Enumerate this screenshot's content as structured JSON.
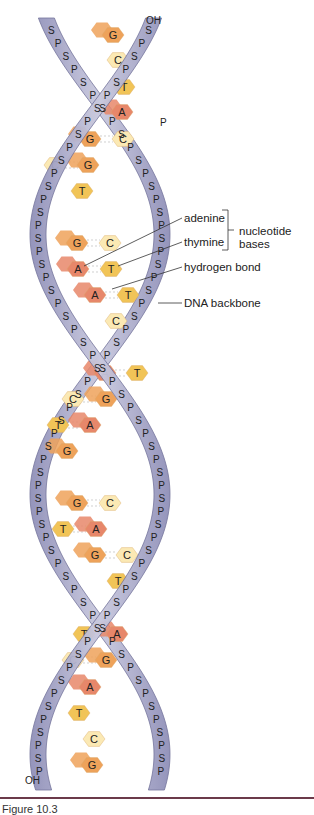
{
  "diagram": {
    "ends": {
      "top_right": "OH",
      "top_left_strand2": "P",
      "bottom_left": "OH"
    },
    "backbone_letters": {
      "sugar": "S",
      "phosphate": "P"
    },
    "colors": {
      "backbone": "#8f8fb8",
      "backbone_light": "#c9c9de",
      "adenine": "#e7876a",
      "thymine": "#f1c457",
      "guanine": "#eea25a",
      "cytosine": "#fbe9b4",
      "leader_line": "#333333",
      "caption_rule": "#6b3a4a"
    },
    "base_pairs": [
      {
        "y": 35,
        "left": {
          "b": "G",
          "x": 113
        },
        "right": null
      },
      {
        "y": 60,
        "left": {
          "b": "C",
          "x": 118
        },
        "right": null
      },
      {
        "y": 87,
        "left": {
          "b": "T",
          "x": 124
        },
        "right": null
      },
      {
        "y": 112,
        "left": {
          "b": "A",
          "x": 122
        },
        "right": null
      },
      {
        "y": 139,
        "left": {
          "b": "G",
          "x": 90
        },
        "right": {
          "b": "C",
          "x": 123
        }
      },
      {
        "y": 165,
        "left": {
          "b": "C",
          "x": 55
        },
        "right": {
          "b": "G",
          "x": 88
        }
      },
      {
        "y": 191,
        "left": null,
        "right": {
          "b": "T",
          "x": 82
        }
      },
      {
        "y": 243,
        "left": {
          "b": "G",
          "x": 77
        },
        "right": {
          "b": "C",
          "x": 110
        }
      },
      {
        "y": 269,
        "left": {
          "b": "A",
          "x": 78
        },
        "right": {
          "b": "T",
          "x": 111
        }
      },
      {
        "y": 295,
        "left": {
          "b": "A",
          "x": 95
        },
        "right": {
          "b": "T",
          "x": 128
        }
      },
      {
        "y": 321,
        "left": null,
        "right": {
          "b": "C",
          "x": 116
        }
      },
      {
        "y": 373,
        "left": {
          "b": "A",
          "x": 105
        },
        "right": {
          "b": "T",
          "x": 137
        }
      },
      {
        "y": 399,
        "left": {
          "b": "C",
          "x": 73
        },
        "right": {
          "b": "G",
          "x": 106
        }
      },
      {
        "y": 425,
        "left": {
          "b": "T",
          "x": 58
        },
        "right": {
          "b": "A",
          "x": 90
        }
      },
      {
        "y": 451,
        "left": {
          "b": "G",
          "x": 67
        },
        "right": null
      },
      {
        "y": 503,
        "left": {
          "b": "G",
          "x": 77
        },
        "right": {
          "b": "C",
          "x": 110
        }
      },
      {
        "y": 529,
        "left": {
          "b": "T",
          "x": 63
        },
        "right": {
          "b": "A",
          "x": 96
        }
      },
      {
        "y": 555,
        "left": {
          "b": "G",
          "x": 95
        },
        "right": {
          "b": "C",
          "x": 127
        }
      },
      {
        "y": 581,
        "left": null,
        "right": {
          "b": "T",
          "x": 118
        }
      },
      {
        "y": 634,
        "left": {
          "b": "T",
          "x": 84
        },
        "right": {
          "b": "A",
          "x": 117
        }
      },
      {
        "y": 660,
        "left": {
          "b": "C",
          "x": 73
        },
        "right": {
          "b": "G",
          "x": 106
        }
      },
      {
        "y": 687,
        "left": {
          "b": "A",
          "x": 90
        },
        "right": null
      },
      {
        "y": 713,
        "left": {
          "b": "T",
          "x": 79
        },
        "right": null
      },
      {
        "y": 739,
        "left": {
          "b": "C",
          "x": 94
        },
        "right": null
      },
      {
        "y": 765,
        "left": {
          "b": "G",
          "x": 92
        },
        "right": null
      }
    ],
    "labels": {
      "adenine": "adenine",
      "thymine": "thymine",
      "nucleotide_bases": [
        "nucleotide",
        "bases"
      ],
      "hydrogen_bond": "hydrogen bond",
      "dna_backbone": "DNA backbone"
    },
    "caption": "Figure 10.3"
  }
}
